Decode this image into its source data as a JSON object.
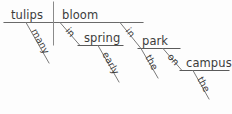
{
  "diagram": {
    "type": "reed-kellogg-sentence-diagram",
    "sentence": "Many tulips bloom in early spring in the park on the campus.",
    "colors": {
      "background": "#fdfdfd",
      "line": "#6a6a6a",
      "text": "#3c3c3c"
    },
    "words": {
      "subject": "tulips",
      "subject_modifier": "many",
      "verb": "bloom",
      "prep1": "in",
      "prep1_object": "spring",
      "prep1_object_modifier": "early",
      "prep2": "in",
      "prep2_object": "park",
      "prep2_object_modifier": "the",
      "prep3": "on",
      "prep3_object": "campus",
      "prep3_object_modifier": "the"
    }
  }
}
